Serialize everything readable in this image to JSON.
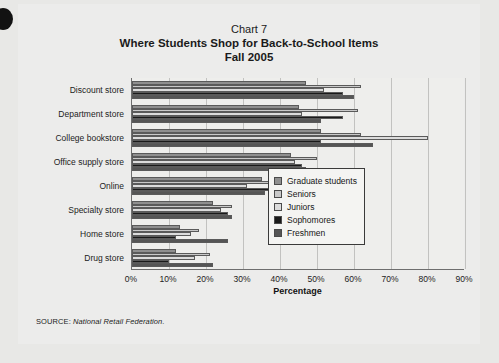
{
  "chart_data": {
    "type": "bar",
    "orientation": "horizontal",
    "title": "Where Students Shop for Back-to-School Items",
    "chart_number": "Chart 7",
    "subtitle": "Fall 2005",
    "xlabel": "Percentage",
    "ylabel": "",
    "xlim": [
      0,
      90
    ],
    "xticks": [
      "0%",
      "10%",
      "20%",
      "30%",
      "40%",
      "50%",
      "60%",
      "70%",
      "80%",
      "90%"
    ],
    "xtick_values": [
      0,
      10,
      20,
      30,
      40,
      50,
      60,
      70,
      80,
      90
    ],
    "grid": true,
    "legend_position": "right-middle",
    "categories": [
      "Discount store",
      "Department store",
      "College bookstore",
      "Office supply store",
      "Online",
      "Specialty store",
      "Home store",
      "Drug store"
    ],
    "series": [
      {
        "name": "Graduate students",
        "color": "#8f8f8f",
        "values": [
          47,
          45,
          51,
          43,
          35,
          22,
          13,
          12
        ]
      },
      {
        "name": "Seniors",
        "color": "#c9c9c9",
        "values": [
          62,
          61,
          62,
          50,
          44,
          27,
          18,
          21
        ]
      },
      {
        "name": "Juniors",
        "color": "#dcdcdc",
        "values": [
          52,
          46,
          80,
          44,
          31,
          24,
          16,
          17
        ]
      },
      {
        "name": "Sophomores",
        "color": "#1a1a1a",
        "values": [
          57,
          57,
          51,
          46,
          41,
          26,
          12,
          10
        ]
      },
      {
        "name": "Freshmen",
        "color": "#555555",
        "values": [
          60,
          51,
          65,
          47,
          36,
          27,
          26,
          22
        ]
      }
    ]
  },
  "source": {
    "label": "SOURCE:",
    "name": "National Retail Federation."
  }
}
